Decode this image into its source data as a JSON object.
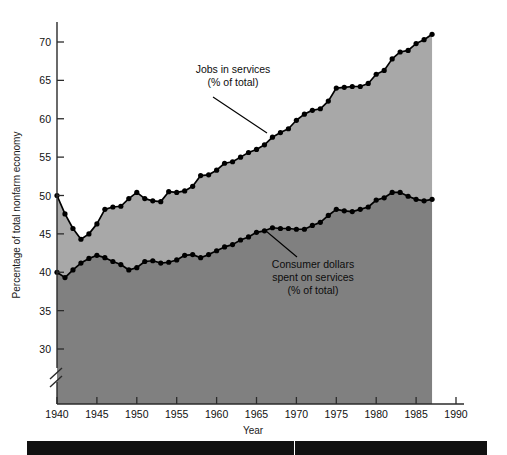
{
  "chart_data": {
    "type": "area",
    "title": "",
    "xlabel": "Year",
    "ylabel": "Percentage of total nonfarm economy",
    "xlim": [
      1940,
      1990
    ],
    "ylim": [
      27,
      72.5
    ],
    "y_axis_break": true,
    "y_break_note": "axis broken below 30",
    "grid": false,
    "legend_position": "inline-annotations",
    "x_ticks": [
      1940,
      1945,
      1950,
      1955,
      1960,
      1965,
      1970,
      1975,
      1980,
      1985,
      1990
    ],
    "y_ticks": [
      30,
      35,
      40,
      45,
      50,
      55,
      60,
      65,
      70
    ],
    "x": [
      1940,
      1941,
      1942,
      1943,
      1944,
      1945,
      1946,
      1947,
      1948,
      1949,
      1950,
      1951,
      1952,
      1953,
      1954,
      1955,
      1956,
      1957,
      1958,
      1959,
      1960,
      1961,
      1962,
      1963,
      1964,
      1965,
      1966,
      1967,
      1968,
      1969,
      1970,
      1971,
      1972,
      1973,
      1974,
      1975,
      1976,
      1977,
      1978,
      1979,
      1980,
      1981,
      1982,
      1983,
      1984,
      1985,
      1986,
      1987
    ],
    "series": [
      {
        "name": "Jobs in services (% of total)",
        "color": "#000000",
        "fill": "#a8a8a8",
        "values": [
          50.0,
          47.6,
          45.7,
          44.3,
          45.0,
          46.3,
          48.2,
          48.5,
          48.6,
          49.6,
          50.4,
          49.6,
          49.3,
          49.2,
          50.5,
          50.4,
          50.6,
          51.2,
          52.6,
          52.7,
          53.3,
          54.2,
          54.4,
          55.0,
          55.6,
          56.0,
          56.6,
          57.6,
          58.2,
          58.7,
          59.8,
          60.6,
          61.1,
          61.3,
          62.3,
          64.0,
          64.1,
          64.2,
          64.2,
          64.6,
          65.8,
          66.3,
          67.8,
          68.7,
          68.9,
          69.8,
          70.3,
          71.0
        ]
      },
      {
        "name": "Consumer dollars spent on services (% of total)",
        "color": "#000000",
        "fill": "#808080",
        "values": [
          40.0,
          39.3,
          40.3,
          41.2,
          41.8,
          42.2,
          41.9,
          41.4,
          41.0,
          40.3,
          40.6,
          41.4,
          41.5,
          41.2,
          41.3,
          41.6,
          42.2,
          42.3,
          41.9,
          42.3,
          42.8,
          43.3,
          43.6,
          44.2,
          44.6,
          45.2,
          45.4,
          45.8,
          45.7,
          45.7,
          45.6,
          45.6,
          46.1,
          46.5,
          47.4,
          48.2,
          48.0,
          47.9,
          48.2,
          48.5,
          49.4,
          49.7,
          50.4,
          50.4,
          49.9,
          49.5,
          49.3,
          49.5
        ]
      }
    ],
    "annotations": [
      {
        "id": "jobs-annotation",
        "line1": "Jobs in services",
        "line2": "(% of total)",
        "text_x": 233,
        "text_y": 73,
        "leader_from_x": 213,
        "leader_from_y": 97,
        "leader_to_x": 267,
        "leader_to_y": 133
      },
      {
        "id": "consumer-annotation",
        "line1": "Consumer dollars",
        "line2": "spent on services",
        "line3": "(% of total)",
        "text_x": 313,
        "text_y": 268,
        "leader_from_x": 266,
        "leader_from_y": 231,
        "leader_to_x": 297,
        "leader_to_y": 257
      }
    ]
  },
  "colors": {
    "upper_band": "#a8a8a8",
    "lower_band": "#808080",
    "line": "#000000",
    "axis": "#2b2b2b",
    "background": "#ffffff",
    "bottom_band": "#111111"
  }
}
